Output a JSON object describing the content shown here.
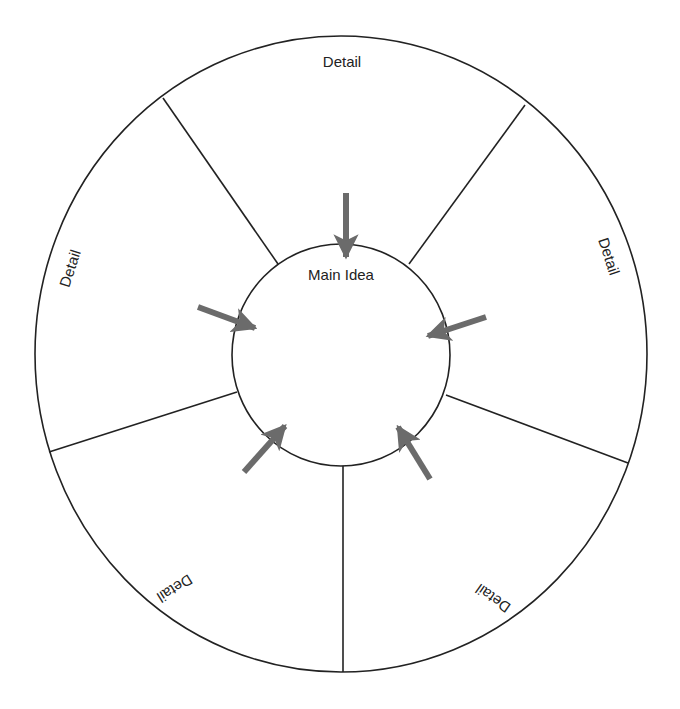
{
  "diagram": {
    "type": "main-idea-wheel",
    "center": {
      "label": "Main Idea"
    },
    "details": [
      {
        "label": "Detail",
        "position": "top"
      },
      {
        "label": "Detail",
        "position": "right"
      },
      {
        "label": "Detail",
        "position": "bottom-right"
      },
      {
        "label": "Detail",
        "position": "bottom-left"
      },
      {
        "label": "Detail",
        "position": "left"
      }
    ],
    "colors": {
      "line": "#222222",
      "arrow": "#6b6b6b",
      "background": "#ffffff"
    }
  }
}
